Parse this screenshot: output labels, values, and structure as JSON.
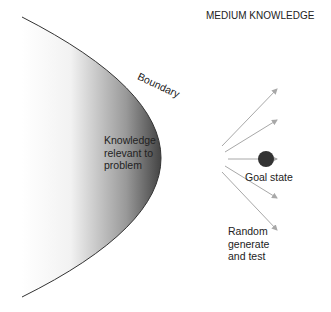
{
  "title": "MEDIUM KNOWLEDGE",
  "boundary_label": "Boundary",
  "region_label": [
    "Knowledge",
    "relevant to",
    "problem"
  ],
  "goal_label": "Goal state",
  "search_label": [
    "Random",
    "generate",
    "and test"
  ],
  "colors": {
    "region_dark": "#444444",
    "arrow": "#a8a8a8",
    "goal": "#333333"
  }
}
